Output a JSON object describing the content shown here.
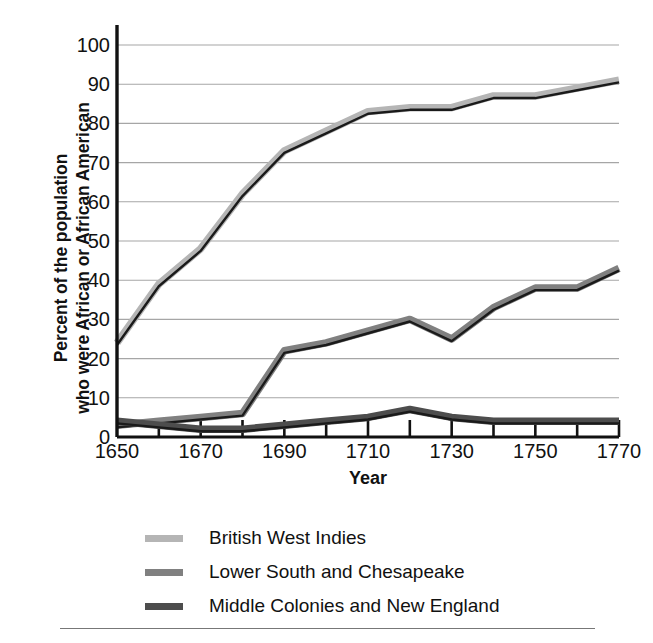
{
  "chart_data": {
    "type": "line",
    "title": "",
    "xlabel": "Year",
    "ylabel": "Percent of the population who were African or African American",
    "ylabel_line1": "Percent of the population",
    "ylabel_line2": "who were African or African American",
    "x": [
      1650,
      1660,
      1670,
      1680,
      1690,
      1700,
      1710,
      1720,
      1730,
      1740,
      1750,
      1760,
      1770
    ],
    "xlim": [
      1650,
      1770
    ],
    "ylim": [
      0,
      100
    ],
    "xticks": [
      1650,
      1670,
      1690,
      1710,
      1730,
      1750,
      1770
    ],
    "xtick_labels": [
      "1650",
      "1670",
      "1690",
      "1710",
      "1730",
      "1750",
      "1770"
    ],
    "xtick_minor": [
      1660,
      1680,
      1700,
      1720,
      1740,
      1760
    ],
    "yticks": [
      0,
      10,
      20,
      30,
      40,
      50,
      60,
      70,
      80,
      90,
      100
    ],
    "ytick_labels": [
      "0",
      "10",
      "20",
      "30",
      "40",
      "50",
      "60",
      "70",
      "80",
      "90",
      "100"
    ],
    "grid": "horizontal",
    "legend_position": "below",
    "series": [
      {
        "name": "British West Indies",
        "color": "#b5b5b5",
        "values": [
          24,
          39,
          48,
          62,
          73,
          78,
          83,
          84,
          84,
          87,
          87,
          89,
          91
        ]
      },
      {
        "name": "Lower South and Chesapeake",
        "color": "#808080",
        "values": [
          3,
          4,
          5,
          6,
          22,
          24,
          27,
          30,
          25,
          33,
          38,
          38,
          43
        ]
      },
      {
        "name": "Middle Colonies and New England",
        "color": "#4d4d4d",
        "values": [
          4,
          3,
          2,
          2,
          3,
          4,
          5,
          7,
          5,
          4,
          4,
          4,
          4
        ]
      }
    ]
  },
  "axis": {
    "xlabel": "Year",
    "ylabel_line1": "Percent of the population",
    "ylabel_line2": "who were African or African American"
  },
  "legend": {
    "items": [
      {
        "label": "British West Indies",
        "color": "#b5b5b5"
      },
      {
        "label": "Lower South and Chesapeake",
        "color": "#808080"
      },
      {
        "label": "Middle Colonies and New England",
        "color": "#4d4d4d"
      }
    ]
  },
  "style": {
    "line_outline": "#1a1a1a",
    "gridline": "#a6a6a6",
    "axis_spine": "#111111",
    "background": "#ffffff",
    "rule": "#777777"
  }
}
